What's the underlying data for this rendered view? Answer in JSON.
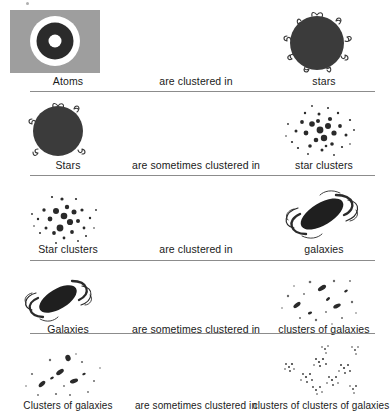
{
  "diagram": {
    "type": "hierarchy-chain",
    "width": 390,
    "height": 416,
    "background_color": "#ffffff",
    "rule_color": "#8c8c8c",
    "ink_color": "#1a1a1a",
    "atom_panel_color": "#9e9e9e",
    "rows": [
      {
        "id": "row-atoms",
        "left_label": "Atoms",
        "relation_label": "are clustered in",
        "right_label": "stars",
        "left_art": "atom-icon",
        "right_art": "star-icon"
      },
      {
        "id": "row-stars",
        "left_label": "Stars",
        "relation_label": "are sometimes clustered in",
        "right_label": "star clusters",
        "left_art": "star-icon",
        "right_art": "star-cluster-icon"
      },
      {
        "id": "row-star-clusters",
        "left_label": "Star clusters",
        "relation_label": "are clustered in",
        "right_label": "galaxies",
        "left_art": "star-cluster-icon",
        "right_art": "galaxy-icon"
      },
      {
        "id": "row-galaxies",
        "left_label": "Galaxies",
        "relation_label": "are sometimes clustered in",
        "right_label": "clusters of galaxies",
        "left_art": "galaxy-icon",
        "right_art": "galaxy-cluster-icon"
      },
      {
        "id": "row-galaxy-clusters",
        "left_label": "Clusters of galaxies",
        "relation_label": "are sometimes clustered in",
        "right_label": "clusters of clusters of galaxies",
        "left_art": "galaxy-cluster-icon",
        "right_art": "supercluster-icon"
      }
    ]
  }
}
